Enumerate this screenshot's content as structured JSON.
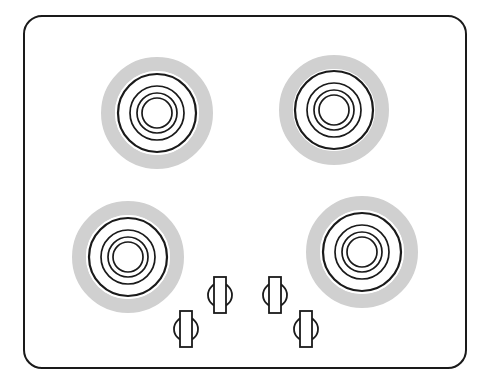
{
  "diagram": {
    "type": "cooktop-top-view",
    "colors": {
      "outline": "#1a1a1a",
      "ring_halo": "#d0d0d0",
      "background": "#ffffff"
    },
    "cooktop": {
      "x": 24,
      "y": 16,
      "width": 442,
      "height": 352,
      "corner_radius": 18
    },
    "burners": [
      {
        "id": "top-left",
        "cx": 157,
        "cy": 113,
        "halo_r": 56,
        "rings": [
          39,
          27,
          20,
          15
        ]
      },
      {
        "id": "top-right",
        "cx": 334,
        "cy": 110,
        "halo_r": 55,
        "rings": [
          39,
          27,
          20,
          15
        ]
      },
      {
        "id": "bottom-left",
        "cx": 128,
        "cy": 257,
        "halo_r": 56,
        "rings": [
          39,
          27,
          20,
          15
        ]
      },
      {
        "id": "bottom-right",
        "cx": 362,
        "cy": 252,
        "halo_r": 56,
        "rings": [
          39,
          27,
          20,
          15
        ]
      }
    ],
    "knobs": [
      {
        "id": "knob-1",
        "cx": 220,
        "cy": 295
      },
      {
        "id": "knob-2",
        "cx": 275,
        "cy": 295
      },
      {
        "id": "knob-3",
        "cx": 186,
        "cy": 329
      },
      {
        "id": "knob-4",
        "cx": 306,
        "cy": 329
      }
    ]
  }
}
